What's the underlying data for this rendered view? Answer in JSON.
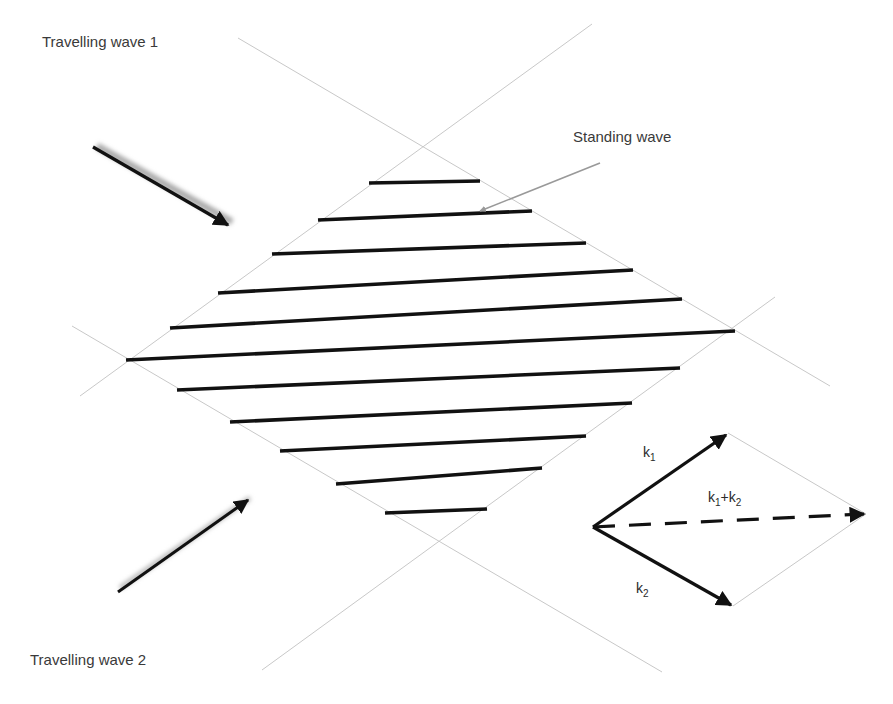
{
  "labels": {
    "wave1": "Travelling wave 1",
    "wave2": "Travelling wave 2",
    "standing": "Standing wave",
    "k1": "k",
    "k1_sub": "1",
    "k2": "k",
    "k2_sub": "2",
    "sum_k1": "k",
    "sum_k1_sub": "1",
    "sum_plus": "+k",
    "sum_k2_sub": "2"
  },
  "colors": {
    "guide_line": "#c8c8c8",
    "fringe": "#111111",
    "arrow": "#111111",
    "text": "#3a3a3a",
    "background": "#ffffff"
  },
  "diagram": {
    "guide_lines": [
      {
        "x1": 238,
        "y1": 38,
        "x2": 830,
        "y2": 386
      },
      {
        "x1": 592,
        "y1": 24,
        "x2": 80,
        "y2": 396
      },
      {
        "x1": 72,
        "y1": 326,
        "x2": 662,
        "y2": 672
      },
      {
        "x1": 775,
        "y1": 297,
        "x2": 262,
        "y2": 670
      }
    ],
    "fringes": [
      {
        "x1": 369,
        "y1": 183,
        "x2": 480,
        "y2": 181
      },
      {
        "x1": 318,
        "y1": 220,
        "x2": 532,
        "y2": 211
      },
      {
        "x1": 272,
        "y1": 254,
        "x2": 586,
        "y2": 243
      },
      {
        "x1": 218,
        "y1": 293,
        "x2": 633,
        "y2": 270
      },
      {
        "x1": 170,
        "y1": 328,
        "x2": 682,
        "y2": 299
      },
      {
        "x1": 126,
        "y1": 360,
        "x2": 735,
        "y2": 331
      },
      {
        "x1": 177,
        "y1": 390,
        "x2": 680,
        "y2": 368
      },
      {
        "x1": 230,
        "y1": 422,
        "x2": 632,
        "y2": 403
      },
      {
        "x1": 280,
        "y1": 451,
        "x2": 586,
        "y2": 436
      },
      {
        "x1": 336,
        "y1": 484,
        "x2": 542,
        "y2": 468
      },
      {
        "x1": 385,
        "y1": 513,
        "x2": 487,
        "y2": 509
      }
    ],
    "wave1_arrow": {
      "x1": 93,
      "y1": 147,
      "x2": 230,
      "y2": 226
    },
    "wave2_arrow": {
      "x1": 118,
      "y1": 592,
      "x2": 250,
      "y2": 498
    },
    "standing_pointer": {
      "x1": 600,
      "y1": 163,
      "x2": 476,
      "y2": 213
    },
    "vectors": {
      "origin": {
        "x": 593,
        "y": 527
      },
      "k1_tip": {
        "x": 728,
        "y": 433
      },
      "k2_tip": {
        "x": 733,
        "y": 606
      },
      "sum_tip": {
        "x": 866,
        "y": 514
      }
    }
  }
}
